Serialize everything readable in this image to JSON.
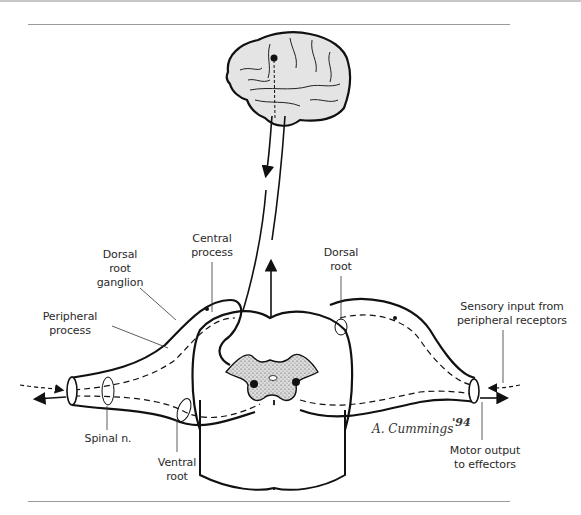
{
  "figure": {
    "labels": {
      "dorsal_root_ganglion": "Dorsal\nroot\nganglion",
      "central_process": "Central\nprocess",
      "peripheral_process": "Peripheral\nprocess",
      "dorsal_root": "Dorsal\nroot",
      "sensory_input": "Sensory input from\nperipheral receptors",
      "spinal_nerve": "Spinal n.",
      "ventral_root": "Ventral\nroot",
      "motor_output": "Motor output\nto effectors"
    },
    "signature": {
      "name": "A. Cummings",
      "year": "'94"
    },
    "colors": {
      "ink": "#111111",
      "brain_fill": "#e4e4e4",
      "gray_matter": "#b9b9b9",
      "rule": "#9a9a9a",
      "background": "#ffffff"
    }
  }
}
